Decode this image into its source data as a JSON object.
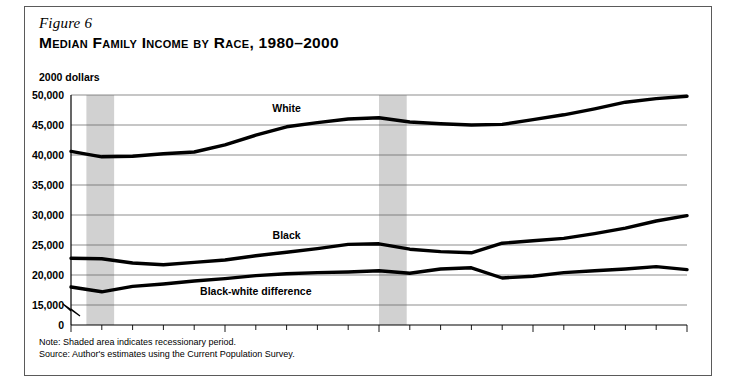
{
  "figure": {
    "label": "Figure 6",
    "title": "Median Family Income by Race, 1980–2000",
    "units": "2000 dollars",
    "note": "Note: Shaded area indicates recessionary period.",
    "source": "Source: Author's estimates using the Current Population Survey."
  },
  "chart_data": {
    "type": "line",
    "title": "Median Family Income by Race, 1980–2000",
    "xlabel": "",
    "ylabel": "2000 dollars",
    "ylim": [
      15000,
      50000
    ],
    "yticks": [
      "0",
      "15,000",
      "20,000",
      "25,000",
      "30,000",
      "35,000",
      "40,000",
      "45,000",
      "50,000"
    ],
    "ytick_values": [
      0,
      15000,
      20000,
      25000,
      30000,
      35000,
      40000,
      45000,
      50000
    ],
    "axis_break": true,
    "xlim": [
      1980,
      2000
    ],
    "xticks": [
      1980,
      1985,
      1990,
      1995,
      2000
    ],
    "xtick_labels": [
      "1980",
      "1985",
      "1990",
      "1995",
      "2000"
    ],
    "x": [
      1980,
      1981,
      1982,
      1983,
      1984,
      1985,
      1986,
      1987,
      1988,
      1989,
      1990,
      1991,
      1992,
      1993,
      1994,
      1995,
      1996,
      1997,
      1998,
      1999,
      2000
    ],
    "grid": true,
    "legend_position": "inline-labels",
    "series": [
      {
        "name": "White",
        "values": [
          40600,
          39700,
          39800,
          40200,
          40500,
          41700,
          43300,
          44700,
          45400,
          46000,
          46200,
          45500,
          45200,
          45000,
          45100,
          45900,
          46700,
          47700,
          48800,
          49400,
          49800
        ]
      },
      {
        "name": "Black",
        "values": [
          22800,
          22700,
          22000,
          21700,
          22100,
          22500,
          23200,
          23800,
          24400,
          25100,
          25200,
          24300,
          23900,
          23700,
          25300,
          25700,
          26100,
          26900,
          27800,
          29000,
          29900
        ]
      },
      {
        "name": "Black-white difference",
        "values": [
          18000,
          17200,
          18100,
          18500,
          19000,
          19400,
          19900,
          20200,
          20400,
          20500,
          20700,
          20300,
          21000,
          21200,
          19500,
          19800,
          20400,
          20700,
          21000,
          21400,
          20900
        ]
      }
    ],
    "annotations": [
      {
        "text": "White",
        "x": 1987,
        "y": 47900
      },
      {
        "text": "Black",
        "x": 1987,
        "y": 26700
      },
      {
        "text": "Black-white difference",
        "x": 1986,
        "y": 17300
      }
    ],
    "shaded_bands": [
      {
        "start": 1980.5,
        "end": 1981.4,
        "label": "recession"
      },
      {
        "start": 1990.0,
        "end": 1990.9,
        "label": "recession"
      }
    ],
    "band_color": "#c9c9c9",
    "line_color": "#000000"
  }
}
